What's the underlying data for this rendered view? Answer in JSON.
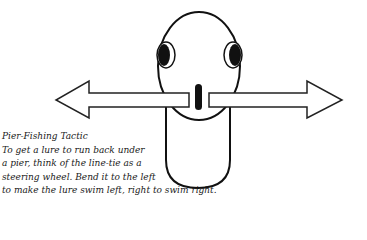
{
  "caption": {
    "title": "Pier-Fishing Tactic",
    "lines": [
      "To get a lure to run back under",
      "a pier, think of the line-tie as a",
      "steering wheel. Bend it to the left",
      "to make the lure swim left, right to swim right."
    ]
  },
  "illustration": {
    "subject": "lure-top-view",
    "arrows": [
      "left",
      "right"
    ],
    "stroke_color": "#111111",
    "fill_color": "#ffffff"
  }
}
